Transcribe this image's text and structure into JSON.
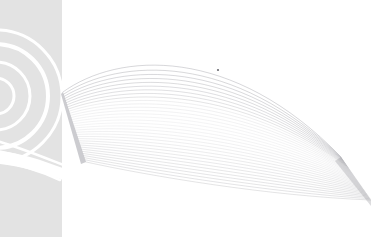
{
  "canvas": {
    "width": 371,
    "height": 237,
    "background_color": "#ffffff",
    "title": "Abstract Ribbon Graphic"
  },
  "side_panel": {
    "name": "left-gray-panel",
    "x": 0,
    "y": 0,
    "width": 62,
    "height": 237,
    "fill_color": "#e3e3e3"
  },
  "rings": {
    "name": "concentric-rings",
    "center_x": -4,
    "center_y": 96,
    "stroke_color": "#ffffff",
    "radii": [
      18,
      34,
      52,
      66
    ],
    "stroke_widths": [
      3,
      3,
      4,
      3
    ]
  },
  "swoosh": {
    "name": "white-swoosh",
    "stroke_color": "#ffffff",
    "curves": [
      "M -10 139 C 14 145 38 155 66 166",
      "M -10 150 C 16 153 40 162 64 174",
      "M -12 161 C 14 162 36 169 60 180"
    ],
    "wedge_path": "M -12 150 C 16 151 44 160 72 172 L 74 184 C 44 172 14 164 -12 163 Z"
  },
  "ribbon": {
    "name": "flowing-ribbon-lines",
    "line_count": 34,
    "stroke_color": "#b9b9bd",
    "stroke_color_dark": "#8f8f96",
    "origin": {
      "x1": 63,
      "y1": 92,
      "x2": 86,
      "y2": 162
    },
    "terminus": {
      "x1": 341,
      "y1": 157,
      "x2": 371,
      "y2": 200
    },
    "opacity_min": 0.22,
    "opacity_max": 0.85
  },
  "speck": {
    "name": "dark-speck",
    "x": 218,
    "y": 70,
    "radius": 1.1,
    "fill_color": "#6a6a70"
  },
  "chart_data": {
    "type": "line",
    "title": "Abstract Ribbon Graphic",
    "xlabel": "",
    "ylabel": "",
    "xlim": [
      0,
      371
    ],
    "ylim": [
      0,
      237
    ],
    "grid": false,
    "legend": "none",
    "series": [
      {
        "name": "ribbon-strand-01",
        "t": 0.0
      },
      {
        "name": "ribbon-strand-34",
        "t": 1.0
      }
    ]
  }
}
